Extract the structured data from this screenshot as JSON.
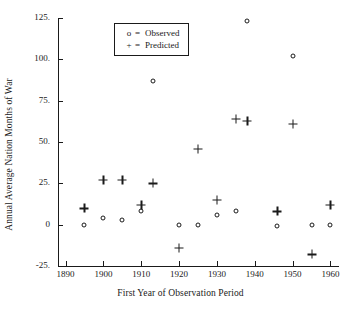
{
  "chart_data": {
    "type": "scatter",
    "title": "",
    "xlabel": "First Year of Observation Period",
    "ylabel": "Annual Average Nation Months of War",
    "xlim": [
      1888,
      1962
    ],
    "ylim": [
      -25,
      125
    ],
    "xticks": [
      1890,
      1900,
      1910,
      1920,
      1930,
      1940,
      1950,
      1960
    ],
    "xticklabels": [
      "1890",
      "1900",
      "1910",
      "1920",
      "1930",
      "1940",
      "1950",
      "1960"
    ],
    "yticks": [
      -25,
      0,
      25,
      50,
      75,
      100,
      125
    ],
    "yticklabels": [
      "-25.",
      "0",
      "25.",
      "50.",
      "75.",
      "100.",
      "125."
    ],
    "grid": false,
    "legend_position": "upper-left-inside",
    "series": [
      {
        "name": "Observed",
        "marker": "o",
        "marker_label": "o",
        "points": [
          {
            "x": 1895,
            "y": 0
          },
          {
            "x": 1900,
            "y": 4
          },
          {
            "x": 1905,
            "y": 3
          },
          {
            "x": 1910,
            "y": 8
          },
          {
            "x": 1913,
            "y": 87
          },
          {
            "x": 1920,
            "y": 0
          },
          {
            "x": 1925,
            "y": 0
          },
          {
            "x": 1930,
            "y": 6
          },
          {
            "x": 1935,
            "y": 8
          },
          {
            "x": 1938,
            "y": 123
          },
          {
            "x": 1946,
            "y": -1
          },
          {
            "x": 1950,
            "y": 102
          },
          {
            "x": 1955,
            "y": 0
          },
          {
            "x": 1960,
            "y": 0
          }
        ]
      },
      {
        "name": "Predicted",
        "marker": "+",
        "marker_label": "+",
        "points": [
          {
            "x": 1895,
            "y": 10
          },
          {
            "x": 1900,
            "y": 27
          },
          {
            "x": 1905,
            "y": 27
          },
          {
            "x": 1910,
            "y": 12
          },
          {
            "x": 1913,
            "y": 25
          },
          {
            "x": 1920,
            "y": -14
          },
          {
            "x": 1925,
            "y": 46
          },
          {
            "x": 1930,
            "y": 15
          },
          {
            "x": 1935,
            "y": 64
          },
          {
            "x": 1938,
            "y": 63
          },
          {
            "x": 1946,
            "y": 8
          },
          {
            "x": 1950,
            "y": 61
          },
          {
            "x": 1955,
            "y": -18
          },
          {
            "x": 1960,
            "y": 12
          }
        ]
      }
    ]
  },
  "legend": {
    "entries": [
      {
        "marker": "o",
        "separator": "=",
        "label": "Observed"
      },
      {
        "marker": "+",
        "separator": "=",
        "label": "Predicted"
      }
    ]
  },
  "colors": {
    "ink": "#1a1a1a",
    "background": "#ffffff"
  }
}
